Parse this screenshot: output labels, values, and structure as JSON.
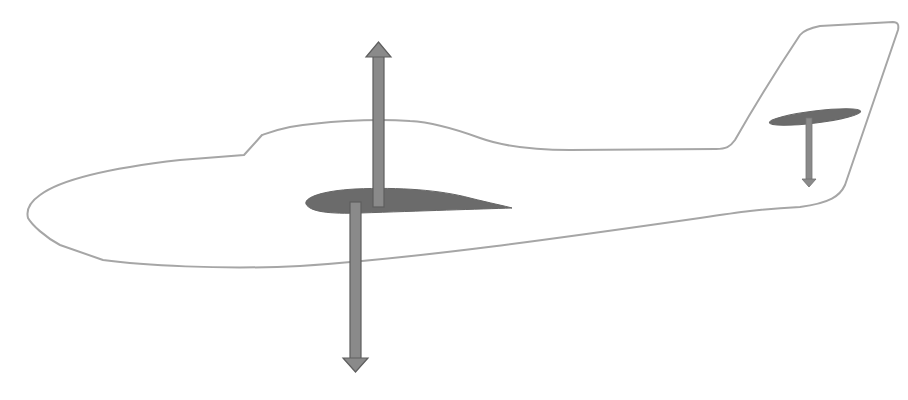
{
  "diagram": {
    "colors": {
      "background": "#ffffff",
      "fuselage_outline": "#a6a6a6",
      "airfoil_fill": "#6b6b6b",
      "arrow_fill": "#8a8a8a",
      "arrow_stroke": "#5e5e5e"
    },
    "elements": [
      {
        "name": "fuselage-outline",
        "type": "outline"
      },
      {
        "name": "main-wing-airfoil",
        "type": "airfoil"
      },
      {
        "name": "lift-arrow",
        "type": "arrow",
        "direction": "up"
      },
      {
        "name": "weight-arrow",
        "type": "arrow",
        "direction": "down"
      },
      {
        "name": "tailplane-airfoil",
        "type": "airfoil"
      },
      {
        "name": "tail-downforce-arrow",
        "type": "arrow",
        "direction": "down"
      }
    ]
  }
}
